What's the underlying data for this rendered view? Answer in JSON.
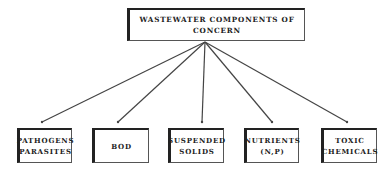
{
  "diagram": {
    "root": {
      "label": "WASTEWATER COMPONENTS OF CONCERN"
    },
    "children": [
      {
        "label": "PATHOGENS\nPARASITES",
        "line1": "PATHOGENS",
        "line2": "PARASITES"
      },
      {
        "label": "BOD",
        "line1": "BOD",
        "line2": ""
      },
      {
        "label": "SUSPENDED\nSOLIDS",
        "line1": "SUSPENDED",
        "line2": "SOLIDS"
      },
      {
        "label": "NUTRIENTS\n(N,P)",
        "line1": "NUTRIENTS",
        "line2": "(N,P)"
      },
      {
        "label": "TOXIC\nCHEMICALS",
        "line1": "TOXIC",
        "line2": "CHEMICALS"
      }
    ],
    "line_color": "#444444"
  }
}
